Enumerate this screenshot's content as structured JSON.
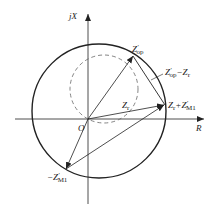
{
  "diagram": {
    "axes": {
      "y_label": "jX",
      "x_label": "R",
      "origin_label": "O"
    },
    "vectors": [
      {
        "id": "z-op",
        "label_main": "Z",
        "label_prime": "′",
        "label_sub": "op"
      },
      {
        "id": "z-r",
        "label_main": "Z",
        "label_sub": "r"
      },
      {
        "id": "z-r-plus-zm1",
        "label_main": "Z",
        "label_sub": "r",
        "label_plus": "+Z",
        "label_prime": "′",
        "label_sub2": "M1"
      },
      {
        "id": "neg-zm1",
        "label_main": "−Z",
        "label_prime": "′",
        "label_sub": "M1"
      },
      {
        "id": "z-op-minus-zr",
        "label_main": "Z",
        "label_prime": "′",
        "label_sub": "op",
        "label_minus": "−Z",
        "label_sub2": "r"
      }
    ],
    "circles": [
      {
        "id": "operating-circle",
        "style": "solid"
      },
      {
        "id": "reference-circle",
        "style": "dashed"
      }
    ],
    "colors": {
      "line": "#222222",
      "dashed": "#666666",
      "background": "#ffffff"
    }
  }
}
